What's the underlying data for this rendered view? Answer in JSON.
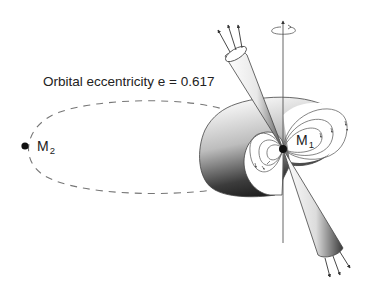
{
  "diagram": {
    "eccentricity_label": "Orbital eccentricity e = 0.617",
    "eccentricity_value": 0.617,
    "bodies": [
      {
        "id": "M1",
        "label_main": "M",
        "label_sub": "1",
        "role": "pulsar with emission beams and magnetic field lines"
      },
      {
        "id": "M2",
        "label_main": "M",
        "label_sub": "2",
        "role": "companion on dashed orbit"
      }
    ],
    "elements": {
      "orbit": "dashed-ellipse",
      "rotation_axis": "vertical-line-with-spin-arrow",
      "beams": [
        "upper-cone-emission-arrows-3",
        "lower-cone-emission-arrows-3"
      ],
      "magnetosphere": "shaded-torus-with-dipole-field-loops"
    },
    "colors": {
      "line": "#555555",
      "dot": "#111111",
      "text": "#222222",
      "dash": "#777777"
    }
  }
}
